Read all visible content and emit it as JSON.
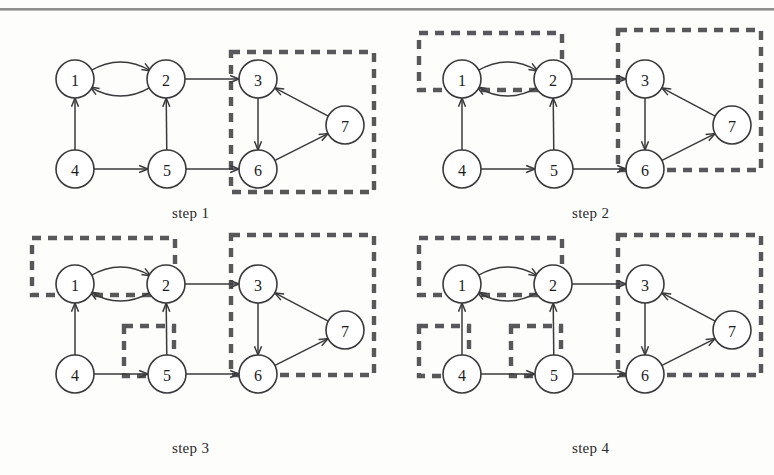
{
  "figure": {
    "type": "diagram",
    "width": 774,
    "height": 475,
    "has_top_rule": true,
    "colors": {
      "background": "#fdfdfc",
      "node_fill": "#ffffff",
      "node_stroke": "#3a3a3c",
      "edge": "#3a3a3c",
      "group_box": "#58585a",
      "text": "#1c1c1e",
      "rule": "#8e8e8e"
    },
    "node_radius": 19
  },
  "graph": {
    "nodes": [
      {
        "id": "1",
        "label": "1",
        "x": 57,
        "y": 57
      },
      {
        "id": "2",
        "label": "2",
        "x": 148,
        "y": 57
      },
      {
        "id": "3",
        "label": "3",
        "x": 240,
        "y": 57
      },
      {
        "id": "7",
        "label": "7",
        "x": 327,
        "y": 103
      },
      {
        "id": "4",
        "label": "4",
        "x": 57,
        "y": 147
      },
      {
        "id": "5",
        "label": "5",
        "x": 149,
        "y": 147
      },
      {
        "id": "6",
        "label": "6",
        "x": 240,
        "y": 147
      }
    ],
    "edges": [
      {
        "from": "2",
        "to": "1",
        "style": "curve",
        "bow": -17
      },
      {
        "from": "1",
        "to": "2",
        "style": "curve",
        "bow": -17
      },
      {
        "from": "2",
        "to": "3",
        "style": "straight"
      },
      {
        "from": "4",
        "to": "1",
        "style": "straight"
      },
      {
        "from": "5",
        "to": "2",
        "style": "straight"
      },
      {
        "from": "4",
        "to": "5",
        "style": "straight"
      },
      {
        "from": "5",
        "to": "6",
        "style": "straight"
      },
      {
        "from": "3",
        "to": "6",
        "style": "straight"
      },
      {
        "from": "6",
        "to": "7",
        "style": "straight"
      },
      {
        "from": "7",
        "to": "3",
        "style": "straight"
      }
    ]
  },
  "steps": [
    {
      "name": "step-1",
      "caption": "step 1",
      "caption_x": 172,
      "caption_y": 205,
      "origin_x": 18,
      "origin_y": 22,
      "groups": [
        {
          "members": [
            "3",
            "6",
            "7"
          ],
          "x": 213,
          "y": 30,
          "width": 143,
          "height": 140
        }
      ]
    },
    {
      "name": "step-2",
      "caption": "step 2",
      "caption_x": 572,
      "caption_y": 205,
      "origin_x": 405,
      "origin_y": 22,
      "groups": [
        {
          "members": [
            "1",
            "2"
          ],
          "x": 14,
          "y": 11,
          "width": 143,
          "height": 57
        },
        {
          "members": [
            "3",
            "6",
            "7"
          ],
          "x": 213,
          "y": 8,
          "width": 143,
          "height": 140
        }
      ]
    },
    {
      "name": "step-3",
      "caption": "step 3",
      "caption_x": 172,
      "caption_y": 440,
      "origin_x": 18,
      "origin_y": 227,
      "groups": [
        {
          "members": [
            "1",
            "2"
          ],
          "x": 14,
          "y": 11,
          "width": 143,
          "height": 57
        },
        {
          "members": [
            "5"
          ],
          "x": 106,
          "y": 99,
          "width": 50,
          "height": 50
        },
        {
          "members": [
            "3",
            "6",
            "7"
          ],
          "x": 213,
          "y": 8,
          "width": 143,
          "height": 140
        }
      ]
    },
    {
      "name": "step-4",
      "caption": "step 4",
      "caption_x": 572,
      "caption_y": 440,
      "origin_x": 405,
      "origin_y": 227,
      "groups": [
        {
          "members": [
            "1",
            "2"
          ],
          "x": 14,
          "y": 11,
          "width": 143,
          "height": 57
        },
        {
          "members": [
            "4"
          ],
          "x": 14,
          "y": 99,
          "width": 50,
          "height": 50
        },
        {
          "members": [
            "5"
          ],
          "x": 106,
          "y": 99,
          "width": 50,
          "height": 50
        },
        {
          "members": [
            "3",
            "6",
            "7"
          ],
          "x": 213,
          "y": 8,
          "width": 143,
          "height": 140
        }
      ]
    }
  ]
}
